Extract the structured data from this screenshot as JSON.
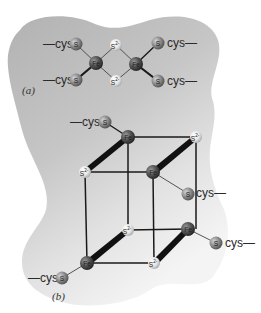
{
  "figure": {
    "panel_a": {
      "label": "(a)",
      "description": "[2Fe-2S] cluster",
      "ligand_left_top": "—cys",
      "ligand_left_bottom": "—cys",
      "ligand_right_top": "cys—",
      "ligand_right_bottom": "cys—",
      "atoms": {
        "s_cys": "S",
        "fe": "Fe",
        "s_sulfide": "S",
        "sulfide_charge": "2-"
      }
    },
    "panel_b": {
      "label": "(b)",
      "description": "[4Fe-4S] cluster",
      "ligand_top": "—cys",
      "ligand_mid_right": "cys—",
      "ligand_right": "cys—",
      "ligand_bottom_left": "—cys",
      "atoms": {
        "s_cys": "S",
        "fe": "Fe",
        "s_sulfide": "S",
        "sulfide_charge": "2-"
      }
    },
    "colors": {
      "background": "#ffffff",
      "blob": "#b9b9b9",
      "blob_light": "#ececec",
      "s_cys_atom": "#8a8a8a",
      "fe_atom": "#555555",
      "sulfide_atom": "#e8e8e8",
      "bond": "#1a1a1a"
    }
  }
}
